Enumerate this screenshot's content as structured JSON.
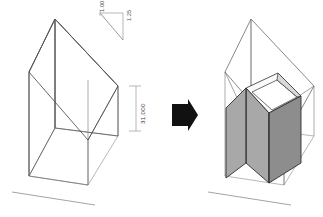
{
  "diagram": {
    "background_color": "#ffffff",
    "arrow": {
      "name": "transform-arrow",
      "direction": "right",
      "color": "#111111"
    },
    "annotations": {
      "slope_run_label": "1.00",
      "slope_rise_label": "1.25",
      "height_label": "31.000"
    },
    "colors": {
      "wireframe_line": "#7a7a7a",
      "wireframe_line_dark": "#4d4d4d",
      "ground_line": "#8c8c8c",
      "dimension_line": "#9a9a9a",
      "solid_face_front": "#a8a8a8",
      "solid_face_side": "#8d8d8d",
      "solid_face_top": "#fbfbfb",
      "solid_face_notch": "#d8d8d8",
      "solid_outline": "#2f2f2f"
    },
    "panels": [
      {
        "name": "envelope-panel",
        "label": "Zoning envelope wireframe",
        "has_solid": false
      },
      {
        "name": "massing-panel",
        "label": "Building massing within envelope",
        "has_solid": true
      }
    ]
  }
}
